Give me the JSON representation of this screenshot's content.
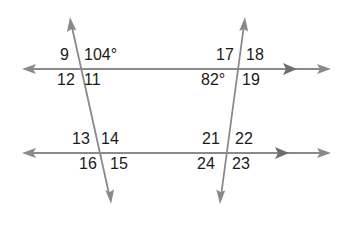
{
  "diagram": {
    "line_color": "#8a8a8a",
    "text_color": "#1a1a1a",
    "parallel_lines": [
      {
        "name": "top-line",
        "y": 69,
        "x1": 22,
        "x2": 330,
        "parallel_marker_x": 290
      },
      {
        "name": "bottom-line",
        "y": 153,
        "x1": 22,
        "x2": 330,
        "parallel_marker_x": 282
      }
    ],
    "transversals": [
      {
        "name": "left-transversal",
        "x1": 70,
        "y1": 18,
        "x2": 111,
        "y2": 203
      },
      {
        "name": "right-transversal",
        "x1": 245,
        "y1": 18,
        "x2": 220,
        "y2": 203
      }
    ],
    "angles": {
      "a9": "9",
      "a104": "104°",
      "a12": "12",
      "a11": "11",
      "a17": "17",
      "a18": "18",
      "a82": "82°",
      "a19": "19",
      "a13": "13",
      "a14": "14",
      "a16": "16",
      "a15": "15",
      "a21": "21",
      "a22": "22",
      "a24": "24",
      "a23": "23"
    }
  }
}
